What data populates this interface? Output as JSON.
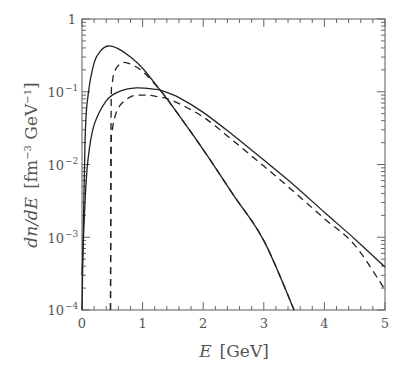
{
  "chart_data": {
    "type": "line",
    "title": "",
    "xlabel": "E [GeV]",
    "ylabel": "dn/dE [fm^-3 GeV^-1]",
    "xlim": [
      0,
      5
    ],
    "ylim": [
      0.0001,
      1
    ],
    "yscale": "log",
    "grid": false,
    "legend": null,
    "x_ticks": [
      "0",
      "1",
      "2",
      "3",
      "4",
      "5"
    ],
    "y_ticks": [
      "1",
      "10^-1",
      "10^-2",
      "10^-3",
      "10^-4"
    ],
    "series": [
      {
        "name": "solid-narrow",
        "style": "solid",
        "x": [
          0.0,
          0.05,
          0.1,
          0.2,
          0.3,
          0.43,
          0.6,
          0.8,
          1.0,
          1.29,
          1.5,
          2.0,
          2.5,
          3.0,
          3.5
        ],
        "y": [
          0.0001,
          0.02,
          0.09,
          0.25,
          0.36,
          0.425,
          0.39,
          0.3,
          0.21,
          0.105,
          0.062,
          0.016,
          0.0038,
          0.0009,
          0.0001
        ]
      },
      {
        "name": "dashed-narrow",
        "style": "dashed",
        "x": [
          0.47,
          0.48,
          0.5,
          0.55,
          0.66,
          0.8,
          1.0,
          1.29,
          1.5,
          2.0,
          2.5,
          3.0,
          3.5
        ],
        "y": [
          0.0001,
          0.05,
          0.13,
          0.2,
          0.25,
          0.24,
          0.19,
          0.105,
          0.062,
          0.016,
          0.0038,
          0.0009,
          0.0001
        ]
      },
      {
        "name": "solid-broad",
        "style": "solid",
        "x": [
          0.0,
          0.05,
          0.1,
          0.2,
          0.4,
          0.6,
          0.9,
          1.2,
          1.29,
          1.6,
          2.0,
          2.5,
          3.0,
          3.5,
          4.0,
          4.5,
          5.0
        ],
        "y": [
          0.0003,
          0.003,
          0.012,
          0.035,
          0.075,
          0.1,
          0.113,
          0.108,
          0.105,
          0.083,
          0.052,
          0.025,
          0.0115,
          0.0052,
          0.0022,
          0.00095,
          0.00039
        ]
      },
      {
        "name": "dashed-broad",
        "style": "dashed",
        "x": [
          0.47,
          0.48,
          0.5,
          0.6,
          0.8,
          1.0,
          1.2,
          1.5,
          2.0,
          2.5,
          3.0,
          3.5,
          4.0,
          4.5,
          5.0
        ],
        "y": [
          0.0001,
          0.012,
          0.03,
          0.06,
          0.085,
          0.09,
          0.087,
          0.075,
          0.045,
          0.021,
          0.0095,
          0.0042,
          0.0018,
          0.00078,
          0.00019
        ]
      }
    ]
  },
  "labels": {
    "x_title_var": "E",
    "x_title_unit": "[GeV]",
    "y_title_var": "dn/dE",
    "y_title_unit_open": "[fm",
    "y_title_unit_exp1": "−3",
    "y_title_unit_mid": " GeV",
    "y_title_unit_exp2": "−1",
    "y_title_unit_close": "]",
    "x_ticks": [
      "0",
      "1",
      "2",
      "3",
      "4",
      "5"
    ],
    "y_tick_bases": [
      "1",
      "10",
      "10",
      "10",
      "10"
    ],
    "y_tick_exps": [
      "",
      "−1",
      "−2",
      "−3",
      "−4"
    ]
  }
}
